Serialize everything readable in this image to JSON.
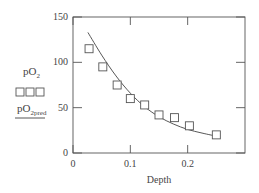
{
  "chart_data": {
    "type": "scatter",
    "title": "",
    "xlabel": "Depth",
    "ylabel": "",
    "xlim": [
      0,
      0.3
    ],
    "ylim": [
      0,
      150
    ],
    "x_ticks": [
      0,
      0.1,
      0.2
    ],
    "x_tick_labels": [
      "0",
      "0.1",
      "0.2"
    ],
    "y_ticks": [
      0,
      50,
      100,
      150
    ],
    "y_tick_labels": [
      "0",
      "50",
      "100",
      "150"
    ],
    "grid": false,
    "legend_position": "left",
    "series": [
      {
        "name": "pO2",
        "marker": "square",
        "x": [
          0.028,
          0.052,
          0.077,
          0.1,
          0.125,
          0.15,
          0.177,
          0.203,
          0.25
        ],
        "y": [
          115,
          95,
          75,
          60,
          53,
          42,
          39,
          30,
          20
        ]
      },
      {
        "name": "pO2pred",
        "style": "line",
        "x": [
          0.026,
          0.05,
          0.075,
          0.1,
          0.125,
          0.15,
          0.175,
          0.2,
          0.225,
          0.254
        ],
        "y": [
          133,
          108,
          85,
          66,
          51,
          40,
          32,
          26,
          22,
          18
        ]
      }
    ]
  },
  "legend": {
    "series1_label": "pO",
    "series1_sub": "2",
    "series1_marker": "□□□",
    "series2_label": "pO",
    "series2_sub": "2pred"
  },
  "colors": {
    "axis": "#555555",
    "marker": "#555555",
    "line": "#444444"
  }
}
